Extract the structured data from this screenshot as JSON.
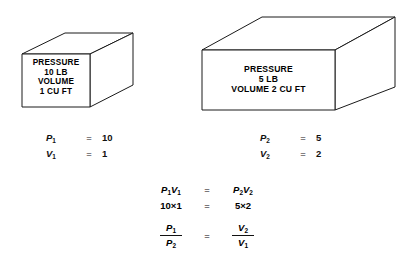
{
  "figure": {
    "stroke_color": "#1a1a1a",
    "background_color": "#ffffff"
  },
  "boxes": [
    {
      "id": "box-left",
      "name": "state-1-container",
      "lines": [
        "PRESSURE",
        "10 LB",
        "VOLUME",
        "1 CU FT"
      ],
      "pressure_label": "PRESSURE",
      "pressure_value": "10 LB",
      "volume_label": "VOLUME",
      "volume_value": "1 CU FT"
    },
    {
      "id": "box-right",
      "name": "state-2-container",
      "lines": [
        "PRESSURE",
        "5 LB",
        "VOLUME 2 CU FT"
      ],
      "pressure_label": "PRESSURE",
      "pressure_value": "5 LB",
      "volume_line": "VOLUME 2 CU FT"
    }
  ],
  "variables_left": [
    {
      "symbol": "P",
      "subscript": "1",
      "equals": "=",
      "value": "10"
    },
    {
      "symbol": "V",
      "subscript": "1",
      "equals": "=",
      "value": "1"
    }
  ],
  "variables_right": [
    {
      "symbol": "P",
      "subscript": "2",
      "equals": "=",
      "value": "5"
    },
    {
      "symbol": "V",
      "subscript": "2",
      "equals": "=",
      "value": "2"
    }
  ],
  "equations": {
    "symbolic": {
      "left_p": "P",
      "left_p_sub": "1",
      "left_v": "V",
      "left_v_sub": "1",
      "equals": "=",
      "right_p": "P",
      "right_p_sub": "2",
      "right_v": "V",
      "right_v_sub": "2"
    },
    "numeric": {
      "left": "10×1",
      "equals": "=",
      "right": "5×2"
    },
    "ratio": {
      "num_left": "P",
      "num_left_sub": "1",
      "den_left": "P",
      "den_left_sub": "2",
      "equals": "=",
      "num_right": "V",
      "num_right_sub": "2",
      "den_right": "V",
      "den_right_sub": "1"
    }
  }
}
